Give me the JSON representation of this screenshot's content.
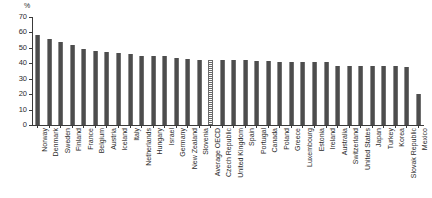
{
  "chart_data": {
    "type": "bar",
    "title": "",
    "subtitle": "",
    "xlabel": "",
    "ylabel": "",
    "unit_label": "%",
    "ylim": [
      0,
      70
    ],
    "ytick_values": [
      0,
      10,
      20,
      30,
      40,
      50,
      60,
      70
    ],
    "ytick_labels": [
      "0",
      "10",
      "20",
      "30",
      "40",
      "50",
      "60",
      "70"
    ],
    "grid": false,
    "legend": "none",
    "highlight_category": "Average OECD",
    "highlight_style": "hatched",
    "bar_color": "#4d4d4d",
    "categories": [
      "Norway",
      "Denmark",
      "Sweden",
      "Finland",
      "France",
      "Belgium",
      "Austria",
      "Iceland",
      "Italy",
      "Netherlands",
      "Hungary",
      "Israel",
      "Germany",
      "New Zealand",
      "Slovenia",
      "Average OECD",
      "Czech Republic",
      "United Kingdom",
      "Spain",
      "Portugal",
      "Canada",
      "Poland",
      "Greece",
      "Luxembourg",
      "Estonia",
      "Ireland",
      "Australia",
      "Switzerland",
      "United States",
      "Japan",
      "Turkey",
      "Korea",
      "Slovak Republic",
      "Mexico"
    ],
    "values": [
      58.5,
      55.5,
      54.0,
      52.0,
      49.5,
      48.0,
      47.5,
      47.0,
      46.0,
      45.0,
      44.5,
      44.5,
      43.5,
      43.0,
      42.0,
      42.0,
      42.0,
      42.0,
      42.0,
      41.5,
      41.5,
      41.0,
      41.0,
      41.0,
      41.0,
      41.0,
      38.5,
      38.0,
      38.0,
      38.0,
      38.0,
      38.5,
      37.5,
      20.0
    ]
  }
}
